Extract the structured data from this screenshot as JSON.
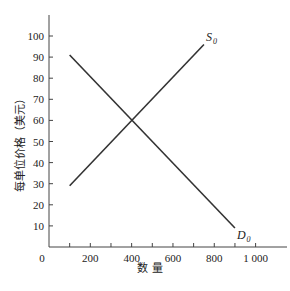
{
  "chart_data": {
    "type": "line",
    "title": "",
    "xlabel": "数 量",
    "ylabel": "每单位价格（美元）",
    "xlim": [
      0,
      1100
    ],
    "ylim": [
      0,
      110
    ],
    "grid": false,
    "x_ticks": [
      100,
      200,
      300,
      400,
      500,
      600,
      700,
      800,
      900,
      1000
    ],
    "x_tick_labels": [
      {
        "value": 0,
        "label": "0"
      },
      {
        "value": 200,
        "label": "200"
      },
      {
        "value": 400,
        "label": "400"
      },
      {
        "value": 600,
        "label": "600"
      },
      {
        "value": 800,
        "label": "800"
      },
      {
        "value": 1000,
        "label": "1 000"
      }
    ],
    "y_ticks": [
      10,
      20,
      30,
      40,
      50,
      60,
      70,
      80,
      90,
      100
    ],
    "y_tick_labels": [
      "10",
      "20",
      "30",
      "40",
      "50",
      "60",
      "70",
      "80",
      "90",
      "100"
    ],
    "series": [
      {
        "name": "S0",
        "label_main": "S",
        "label_sub": "0",
        "label_at": "end",
        "x": [
          100,
          750
        ],
        "y": [
          29,
          96
        ]
      },
      {
        "name": "D0",
        "label_main": "D",
        "label_sub": "0",
        "label_at": "end",
        "x": [
          100,
          900
        ],
        "y": [
          91,
          9
        ]
      }
    ],
    "colors": {
      "line": "#333333",
      "axis": "#444444"
    }
  }
}
